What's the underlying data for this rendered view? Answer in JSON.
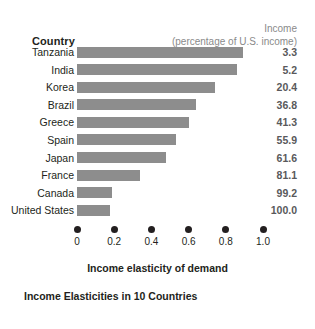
{
  "chart_data": {
    "type": "bar",
    "title": "Income Elasticities in 10 Countries",
    "xlabel": "Income elasticity of demand",
    "ylabel": "Country",
    "orientation": "horizontal",
    "xlim": [
      0,
      1.0
    ],
    "xticks": [
      "0",
      "0.2",
      "0.4",
      "0.6",
      "0.8",
      "1.0"
    ],
    "xtick_values": [
      0,
      0.2,
      0.4,
      0.6,
      0.8,
      1.0
    ],
    "grid": false,
    "legend": "none",
    "categories": [
      "Tanzania",
      "India",
      "Korea",
      "Brazil",
      "Greece",
      "Spain",
      "Japan",
      "France",
      "Canada",
      "United States"
    ],
    "values": [
      0.89,
      0.86,
      0.74,
      0.64,
      0.6,
      0.53,
      0.48,
      0.34,
      0.19,
      0.18
    ],
    "series": [
      {
        "name": "Income elasticity of demand",
        "values": [
          0.89,
          0.86,
          0.74,
          0.64,
          0.6,
          0.53,
          0.48,
          0.34,
          0.19,
          0.18
        ]
      },
      {
        "name": "Income (percentage of U.S. income)",
        "values": [
          3.3,
          5.2,
          20.4,
          36.8,
          41.3,
          55.9,
          61.6,
          81.1,
          99.2,
          100.0
        ]
      }
    ],
    "bar_color": "#8d8d8d",
    "text_color": "#231f20",
    "header_color": "#8a8a8a"
  },
  "header": {
    "country_label": "Country",
    "income_line1": "Income",
    "income_line2": "(percentage of U.S. income)"
  },
  "rows": [
    {
      "country": "Tanzania",
      "elasticity": 0.89,
      "income": "3.3"
    },
    {
      "country": "India",
      "elasticity": 0.86,
      "income": "5.2"
    },
    {
      "country": "Korea",
      "elasticity": 0.74,
      "income": "20.4"
    },
    {
      "country": "Brazil",
      "elasticity": 0.64,
      "income": "36.8"
    },
    {
      "country": "Greece",
      "elasticity": 0.6,
      "income": "41.3"
    },
    {
      "country": "Spain",
      "elasticity": 0.53,
      "income": "55.9"
    },
    {
      "country": "Japan",
      "elasticity": 0.48,
      "income": "61.6"
    },
    {
      "country": "France",
      "elasticity": 0.34,
      "income": "81.1"
    },
    {
      "country": "Canada",
      "elasticity": 0.19,
      "income": "99.2"
    },
    {
      "country": "United States",
      "elasticity": 0.18,
      "income": "100.0"
    }
  ],
  "axis": {
    "ticks": [
      {
        "label": "0",
        "value": 0
      },
      {
        "label": "0.2",
        "value": 0.2
      },
      {
        "label": "0.4",
        "value": 0.4
      },
      {
        "label": "0.6",
        "value": 0.6
      },
      {
        "label": "0.8",
        "value": 0.8
      },
      {
        "label": "1.0",
        "value": 1.0
      }
    ],
    "title": "Income elasticity of demand"
  },
  "caption": "Income Elasticities in 10 Countries"
}
